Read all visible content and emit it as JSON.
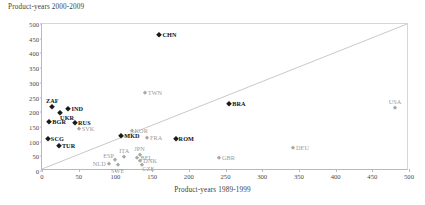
{
  "chart_data": {
    "type": "scatter",
    "title": "",
    "ylabel": "Product-years 2000-2009",
    "xlabel": "Product-years 1989-1999",
    "xlim": [
      0,
      500
    ],
    "ylim": [
      0,
      500
    ],
    "xticks": [
      0,
      50,
      100,
      150,
      200,
      250,
      300,
      350,
      400,
      450,
      500
    ],
    "yticks": [
      0,
      50,
      100,
      150,
      200,
      250,
      300,
      350,
      400,
      450,
      500
    ],
    "grid": false,
    "legend": "none",
    "annotations": [
      {
        "name": "diagonal-45-line",
        "from": [
          0,
          0
        ],
        "to": [
          500,
          500
        ],
        "color": "#c3c3c3"
      }
    ],
    "colors": {
      "highlight": "#1a1a1a",
      "normal": "#a8a8a8",
      "axis": "#b9b9b9",
      "text": "#404040"
    },
    "points": [
      {
        "label": "CHN",
        "x": 160,
        "y": 462,
        "emphasis": "dark",
        "lpos": "right"
      },
      {
        "label": "TWN",
        "x": 140,
        "y": 265,
        "emphasis": "light",
        "lpos": "right"
      },
      {
        "label": "ZAF",
        "x": 14,
        "y": 217,
        "emphasis": "dark",
        "lpos": "above"
      },
      {
        "label": "IND",
        "x": 36,
        "y": 210,
        "emphasis": "dark",
        "lpos": "right"
      },
      {
        "label": "UKR",
        "x": 24,
        "y": 196,
        "emphasis": "dark",
        "lpos": "belowright"
      },
      {
        "label": "USA",
        "x": 481,
        "y": 215,
        "emphasis": "light",
        "lpos": "above"
      },
      {
        "label": "BRA",
        "x": 255,
        "y": 228,
        "emphasis": "dark",
        "lpos": "right"
      },
      {
        "label": "BGR",
        "x": 10,
        "y": 166,
        "emphasis": "dark",
        "lpos": "right"
      },
      {
        "label": "RUS",
        "x": 45,
        "y": 163,
        "emphasis": "dark",
        "lpos": "right"
      },
      {
        "label": "SVK",
        "x": 50,
        "y": 143,
        "emphasis": "light",
        "lpos": "right"
      },
      {
        "label": "KOR",
        "x": 122,
        "y": 137,
        "emphasis": "light",
        "lpos": "right"
      },
      {
        "label": "MKD",
        "x": 108,
        "y": 119,
        "emphasis": "dark",
        "lpos": "right"
      },
      {
        "label": "FRA",
        "x": 143,
        "y": 113,
        "emphasis": "light",
        "lpos": "right"
      },
      {
        "label": "ROM",
        "x": 182,
        "y": 108,
        "emphasis": "dark",
        "lpos": "right"
      },
      {
        "label": "SCG",
        "x": 8,
        "y": 110,
        "emphasis": "dark",
        "lpos": "right"
      },
      {
        "label": "TUR",
        "x": 23,
        "y": 86,
        "emphasis": "dark",
        "lpos": "right"
      },
      {
        "label": "DEU",
        "x": 342,
        "y": 78,
        "emphasis": "light",
        "lpos": "right"
      },
      {
        "label": "GBR",
        "x": 241,
        "y": 44,
        "emphasis": "light",
        "lpos": "right"
      },
      {
        "label": "JPN",
        "x": 133,
        "y": 55,
        "emphasis": "light",
        "lpos": "above"
      },
      {
        "label": "BEL",
        "x": 130,
        "y": 44,
        "emphasis": "light",
        "lpos": "right"
      },
      {
        "label": "DNK",
        "x": 134,
        "y": 34,
        "emphasis": "light",
        "lpos": "right"
      },
      {
        "label": "CZE",
        "x": 136,
        "y": 22,
        "emphasis": "light",
        "lpos": "belowright"
      },
      {
        "label": "ITA",
        "x": 112,
        "y": 48,
        "emphasis": "light",
        "lpos": "above"
      },
      {
        "label": "ESP",
        "x": 99,
        "y": 36,
        "emphasis": "light",
        "lpos": "aboveleft"
      },
      {
        "label": "NLD",
        "x": 91,
        "y": 25,
        "emphasis": "light",
        "lpos": "left"
      },
      {
        "label": "SWE",
        "x": 103,
        "y": 20,
        "emphasis": "light",
        "lpos": "below"
      }
    ]
  }
}
